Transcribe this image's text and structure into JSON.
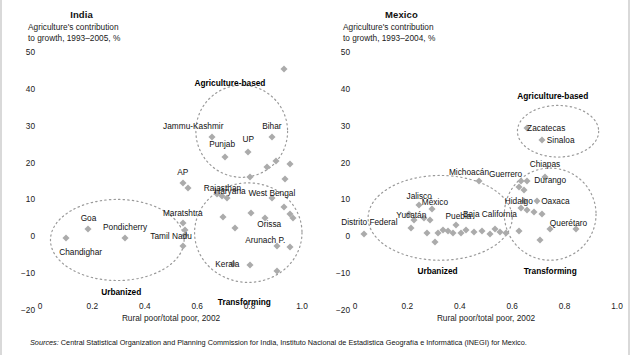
{
  "sources_note": "Sources: Central Statistical Organization and Planning Commission for India, Instituto Nacional de Estadistica Geografía e Informática (INEGI) for Mexico.",
  "sources_prefix": "Sources:",
  "sources_body": " Central Statistical Organization and Planning Commission for India, Instituto Nacional de Estadistica Geografía e Informática (INEGI) for Mexico.",
  "colors": {
    "marker": "#ababab",
    "ellipse": "#9a9a9a",
    "text": "#111111",
    "frame_border": "#d9d9d9"
  },
  "panels": [
    {
      "id": "india",
      "title": "India",
      "ylabel": "Agriculture's contribution\nto growth, 1993–2005, %",
      "xlabel": "Rural poor/total poor, 2002",
      "yticks": [
        "50",
        "40",
        "30",
        "20",
        "10",
        "0",
        "−10",
        "−20"
      ],
      "ytick_values": [
        50,
        40,
        30,
        20,
        10,
        0,
        -10,
        -20
      ],
      "xticks": [
        "0",
        "0.2",
        "0.4",
        "0.6",
        "0.8",
        "1.0"
      ],
      "xtick_values": [
        0,
        0.2,
        0.4,
        0.6,
        0.8,
        1.0
      ],
      "clusters": [
        {
          "name": "Agriculture-based",
          "cx": 0.77,
          "cy": 28.5,
          "rx": 0.175,
          "ry": 12.5
        },
        {
          "name": "Urbanized",
          "cx": 0.295,
          "cy": -1.0,
          "rx": 0.255,
          "ry": 11.0
        },
        {
          "name": "Transforming",
          "cx": 0.795,
          "cy": 1.0,
          "rx": 0.205,
          "ry": 13.5
        }
      ],
      "cluster_labels": [
        {
          "text": "Agriculture-based",
          "x": 0.725,
          "y": 41.5
        },
        {
          "text": "Urbanized",
          "x": 0.31,
          "y": -15.0
        },
        {
          "text": "Transforming",
          "x": 0.78,
          "y": -17.8
        }
      ],
      "labeled_points": [
        {
          "name": "Jammu-Kashmir",
          "x": 0.655,
          "y": 27.0,
          "lx": 0.585,
          "ly": 30.0,
          "anchor": "middle"
        },
        {
          "name": "Bihar",
          "x": 0.885,
          "y": 27.0,
          "lx": 0.885,
          "ly": 30.0,
          "anchor": "middle"
        },
        {
          "name": "Punjab",
          "x": 0.705,
          "y": 21.5,
          "lx": 0.695,
          "ly": 25.0,
          "anchor": "middle"
        },
        {
          "name": "UP",
          "x": 0.795,
          "y": 23.0,
          "lx": 0.795,
          "ly": 26.5,
          "anchor": "middle"
        },
        {
          "name": "AP",
          "x": 0.545,
          "y": 14.5,
          "lx": 0.545,
          "ly": 17.5,
          "anchor": "middle"
        },
        {
          "name": "Rajasthan",
          "x": 0.565,
          "y": 13.0,
          "lx": 0.625,
          "ly": 13.2,
          "anchor": "start"
        },
        {
          "name": "Haryana",
          "x": 0.715,
          "y": 10.5,
          "lx": 0.725,
          "ly": 12.2,
          "anchor": "middle"
        },
        {
          "name": "West Bengal",
          "x": 0.885,
          "y": 10.5,
          "lx": 0.885,
          "ly": 11.8,
          "anchor": "middle"
        },
        {
          "name": "Maratshtra",
          "x": 0.545,
          "y": 3.5,
          "lx": 0.545,
          "ly": 6.3,
          "anchor": "middle"
        },
        {
          "name": "Orissa",
          "x": 0.86,
          "y": 5.0,
          "lx": 0.875,
          "ly": 3.4,
          "anchor": "middle"
        },
        {
          "name": "Goa",
          "x": 0.185,
          "y": 2.0,
          "lx": 0.185,
          "ly": 5.0,
          "anchor": "middle"
        },
        {
          "name": "Pondicherry",
          "x": 0.325,
          "y": -0.5,
          "lx": 0.325,
          "ly": 2.6,
          "anchor": "middle"
        },
        {
          "name": "Tamil Nadu",
          "x": 0.545,
          "y": -2.5,
          "lx": 0.5,
          "ly": 0.1,
          "anchor": "middle"
        },
        {
          "name": "Chandighar",
          "x": 0.1,
          "y": -0.5,
          "lx": 0.155,
          "ly": -4.2,
          "anchor": "middle"
        },
        {
          "name": "Arunach P.",
          "x": 0.905,
          "y": -2.5,
          "lx": 0.86,
          "ly": -1.1,
          "anchor": "middle"
        },
        {
          "name": "Kerala",
          "x": 0.735,
          "y": -7.5,
          "lx": 0.715,
          "ly": -7.5,
          "anchor": "middle"
        }
      ],
      "extra_points": [
        {
          "x": 0.93,
          "y": 45.5
        },
        {
          "x": 0.9,
          "y": 20.5
        },
        {
          "x": 0.955,
          "y": 19.5
        },
        {
          "x": 0.865,
          "y": 18.8
        },
        {
          "x": 0.935,
          "y": 15.5
        },
        {
          "x": 0.8,
          "y": 16.0
        },
        {
          "x": 0.675,
          "y": 11.6
        },
        {
          "x": 0.695,
          "y": 11.0
        },
        {
          "x": 0.93,
          "y": 8.0
        },
        {
          "x": 0.955,
          "y": 6.0
        },
        {
          "x": 0.965,
          "y": 5.0
        },
        {
          "x": 0.805,
          "y": 6.2
        },
        {
          "x": 0.7,
          "y": 5.2
        },
        {
          "x": 0.745,
          "y": 2.2
        },
        {
          "x": 0.555,
          "y": 1.8
        },
        {
          "x": 0.555,
          "y": 0.4
        },
        {
          "x": 0.8,
          "y": -7.8
        },
        {
          "x": 0.905,
          "y": -9.5
        },
        {
          "x": 0.955,
          "y": -3.0
        }
      ]
    },
    {
      "id": "mexico",
      "title": "Mexico",
      "ylabel": "Agriculture's contribution\nto growth, 1993–2004, %",
      "xlabel": "Rural poor/total poor, 2002",
      "yticks": [
        "50",
        "40",
        "30",
        "20",
        "10",
        "0",
        "−10",
        "−20"
      ],
      "ytick_values": [
        50,
        40,
        30,
        20,
        10,
        0,
        -10,
        -20
      ],
      "xticks": [
        "0",
        "0.2",
        "0.4",
        "0.6",
        "0.8",
        "1.0"
      ],
      "xtick_values": [
        0,
        0.2,
        0.4,
        0.6,
        0.8,
        1.0
      ],
      "clusters": [
        {
          "name": "Agriculture-based",
          "cx": 0.775,
          "cy": 28.5,
          "rx": 0.155,
          "ry": 7.0
        },
        {
          "name": "Urbanized",
          "cx": 0.325,
          "cy": 5.0,
          "rx": 0.275,
          "ry": 11.5
        },
        {
          "name": "Transforming",
          "cx": 0.745,
          "cy": 6.0,
          "rx": 0.175,
          "ry": 12.5
        }
      ],
      "cluster_labels": [
        {
          "text": "Agriculture-based",
          "x": 0.755,
          "y": 38.0
        },
        {
          "text": "Urbanized",
          "x": 0.315,
          "y": -9.5
        },
        {
          "text": "Transforming",
          "x": 0.745,
          "y": -9.5
        }
      ],
      "labeled_points": [
        {
          "name": "Zacatecas",
          "x": 0.655,
          "y": 29.5,
          "lx": 0.73,
          "ly": 29.5,
          "anchor": "middle"
        },
        {
          "name": "Sinaloa",
          "x": 0.715,
          "y": 26.0,
          "lx": 0.785,
          "ly": 26.0,
          "anchor": "middle"
        },
        {
          "name": "Chiapas",
          "x": 0.725,
          "y": 16.0,
          "lx": 0.725,
          "ly": 19.5,
          "anchor": "middle"
        },
        {
          "name": "Michoacán",
          "x": 0.475,
          "y": 15.0,
          "lx": 0.435,
          "ly": 17.5,
          "anchor": "middle"
        },
        {
          "name": "Guerrero",
          "x": 0.635,
          "y": 15.0,
          "lx": 0.575,
          "ly": 17.0,
          "anchor": "middle"
        },
        {
          "name": "Durango",
          "x": 0.655,
          "y": 15.0,
          "lx": 0.745,
          "ly": 15.2,
          "anchor": "middle"
        },
        {
          "name": "Jalisco",
          "x": 0.245,
          "y": 8.5,
          "lx": 0.245,
          "ly": 11.0,
          "anchor": "middle"
        },
        {
          "name": "México",
          "x": 0.295,
          "y": 7.5,
          "lx": 0.305,
          "ly": 9.3,
          "anchor": "middle"
        },
        {
          "name": "Hidalgo",
          "x": 0.645,
          "y": 9.5,
          "lx": 0.625,
          "ly": 9.6,
          "anchor": "middle"
        },
        {
          "name": "Oaxaca",
          "x": 0.695,
          "y": 9.5,
          "lx": 0.765,
          "ly": 9.6,
          "anchor": "middle"
        },
        {
          "name": "Yucatán",
          "x": 0.225,
          "y": 4.5,
          "lx": 0.215,
          "ly": 5.8,
          "anchor": "middle"
        },
        {
          "name": "Puebla",
          "x": 0.385,
          "y": 3.0,
          "lx": 0.395,
          "ly": 5.6,
          "anchor": "middle"
        },
        {
          "name": "Baja California",
          "x": 0.535,
          "y": 2.0,
          "lx": 0.515,
          "ly": 6.0,
          "anchor": "middle"
        },
        {
          "name": "Distrito Federal",
          "x": 0.035,
          "y": 0.5,
          "lx": 0.055,
          "ly": 4.0,
          "anchor": "middle"
        },
        {
          "name": "Querétaro",
          "x": 0.845,
          "y": 2.0,
          "lx": 0.815,
          "ly": 3.5,
          "anchor": "middle"
        }
      ],
      "extra_points": [
        {
          "x": 0.205,
          "y": 6.0
        },
        {
          "x": 0.265,
          "y": 5.0
        },
        {
          "x": 0.285,
          "y": 4.3
        },
        {
          "x": 0.215,
          "y": 2.2
        },
        {
          "x": 0.275,
          "y": 1.0
        },
        {
          "x": 0.315,
          "y": 0.8
        },
        {
          "x": 0.335,
          "y": 1.8
        },
        {
          "x": 0.355,
          "y": 1.3
        },
        {
          "x": 0.375,
          "y": 1.0
        },
        {
          "x": 0.405,
          "y": 0.8
        },
        {
          "x": 0.425,
          "y": 1.6
        },
        {
          "x": 0.455,
          "y": 1.2
        },
        {
          "x": 0.485,
          "y": 1.4
        },
        {
          "x": 0.305,
          "y": -1.5
        },
        {
          "x": 0.515,
          "y": 0.6
        },
        {
          "x": 0.555,
          "y": 1.2
        },
        {
          "x": 0.575,
          "y": 0.8
        },
        {
          "x": 0.625,
          "y": 13.5
        },
        {
          "x": 0.645,
          "y": 12.5
        },
        {
          "x": 0.635,
          "y": 7.8
        },
        {
          "x": 0.655,
          "y": 7.0
        },
        {
          "x": 0.685,
          "y": 6.5
        },
        {
          "x": 0.715,
          "y": 6.0
        },
        {
          "x": 0.745,
          "y": 2.0
        },
        {
          "x": 0.705,
          "y": -1.0
        },
        {
          "x": 0.625,
          "y": 1.5
        }
      ]
    }
  ]
}
